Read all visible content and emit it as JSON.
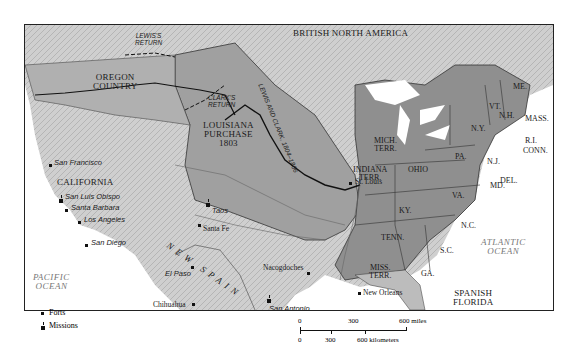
{
  "map": {
    "title_regions": {
      "british_north_america": "BRITISH NORTH AMERICA",
      "oregon_country": [
        "OREGON",
        "COUNTRY"
      ],
      "louisiana_purchase": [
        "LOUISIANA",
        "PURCHASE",
        "1803"
      ],
      "california": "CALIFORNIA",
      "new_spain": "NEW SPAIN",
      "spanish_florida": [
        "SPANISH",
        "FLORIDA"
      ]
    },
    "routes": {
      "lewis_return": [
        "LEWIS'S",
        "RETURN"
      ],
      "clark_return": [
        "CLARK'S",
        "RETURN"
      ],
      "lewis_and_clark": "LEWIS AND CLARK, 1804–1806"
    },
    "territories": [
      {
        "id": "mich",
        "label": [
          "MICH.",
          "TERR."
        ]
      },
      {
        "id": "indiana",
        "label": [
          "INDIANA",
          "TERR."
        ]
      },
      {
        "id": "miss",
        "label": [
          "MISS.",
          "TERR."
        ]
      }
    ],
    "states": [
      "ME.",
      "VT.",
      "N.H.",
      "MASS.",
      "N.Y.",
      "R.I.",
      "CONN.",
      "PA.",
      "N.J.",
      "DEL.",
      "MD.",
      "OHIO",
      "KY.",
      "VA.",
      "N.C.",
      "TENN.",
      "S.C.",
      "GA."
    ],
    "cities": [
      {
        "name": "San Francisco",
        "type": "fort"
      },
      {
        "name": "San Luis Obispo",
        "type": "mission"
      },
      {
        "name": "Santa Barbara",
        "type": "fort"
      },
      {
        "name": "Los Angeles",
        "type": "fort"
      },
      {
        "name": "San Diego",
        "type": "fort"
      },
      {
        "name": "Taos",
        "type": "mission"
      },
      {
        "name": "Santa Fe",
        "type": "town"
      },
      {
        "name": "El Paso",
        "type": "fort"
      },
      {
        "name": "Chihuahua",
        "type": "town"
      },
      {
        "name": "Nacogdoches",
        "type": "town"
      },
      {
        "name": "San Antonio",
        "type": "mission"
      },
      {
        "name": "New Orleans",
        "type": "town"
      },
      {
        "name": "St. Louis",
        "type": "town"
      }
    ],
    "rivers": [
      "Missouri R.",
      "Arkansas R.",
      "Red R.",
      "Mississippi R."
    ],
    "oceans": {
      "pacific": [
        "PACIFIC",
        "OCEAN"
      ],
      "atlantic": [
        "ATLANTIC",
        "OCEAN"
      ]
    },
    "legend": {
      "forts": "Forts",
      "missions": "Missions"
    },
    "scale": {
      "miles_ticks": [
        "0",
        "300",
        "600 miles"
      ],
      "km_ticks": [
        "0",
        "300",
        "600 kilometers"
      ]
    },
    "colors": {
      "us_fill": "#8f8f8f",
      "terr_fill": "#a9a9a9",
      "foreign_fill": "#c8c8c8",
      "water": "#ffffff",
      "border": "#333333"
    }
  }
}
